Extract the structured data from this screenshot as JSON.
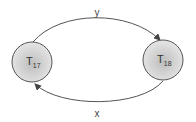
{
  "diagram": {
    "type": "state-transition",
    "nodes": [
      {
        "id": "t17",
        "label": "T",
        "subscript": "17"
      },
      {
        "id": "t18",
        "label": "T",
        "subscript": "18"
      }
    ],
    "edges": [
      {
        "from": "t17",
        "to": "t18",
        "label": "y",
        "position": "top"
      },
      {
        "from": "t18",
        "to": "t17",
        "label": "x",
        "position": "bottom"
      }
    ],
    "colors": {
      "edge": "#555555",
      "node_border": "#555555",
      "node_fill_center": "#c4c4c4",
      "node_fill_edge": "#e2e2e2"
    }
  }
}
